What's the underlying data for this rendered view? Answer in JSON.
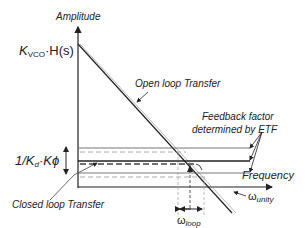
{
  "diagram": {
    "axes": {
      "y_label": "Amplitude",
      "x_label": "Frequency"
    },
    "labels": {
      "kvco_main": "K",
      "kvco_sub": "VCO",
      "kvco_rest": "·H(s)",
      "feedback_main": "1/K",
      "feedback_sub": "d",
      "feedback_rest": "·Kϕ",
      "open_loop": "Open loop Transfer",
      "feedback_factor_line1": "Feedback factor",
      "feedback_factor_line2": "determined by ETF",
      "closed_loop": "Closed loop Transfer",
      "omega": "ω",
      "omega_loop_sub": "loop",
      "omega_unity_sub": "unity"
    },
    "colors": {
      "line": "#222222",
      "grid": "#999999"
    }
  }
}
